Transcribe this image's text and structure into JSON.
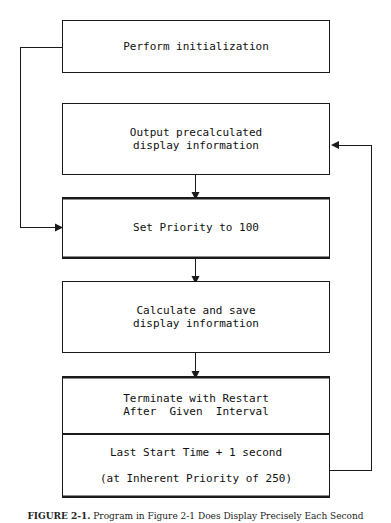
{
  "diagram": {
    "colors": {
      "line": "#1a1a1a",
      "text": "#101010",
      "background": "#ffffff"
    },
    "nodes": [
      {
        "id": "perform-initialization",
        "lines": [
          "Perform initialization"
        ],
        "style": "single"
      },
      {
        "id": "output-precalculated",
        "lines": [
          "Output precalculated",
          "display information"
        ],
        "style": "single"
      },
      {
        "id": "set-priority",
        "lines": [
          "Set Priority to 100"
        ],
        "style": "double-rule"
      },
      {
        "id": "calculate-and-save",
        "lines": [
          "Calculate and save",
          "display information"
        ],
        "style": "single"
      }
    ],
    "terminal_block": {
      "id": "terminate-with-restart",
      "style": "double-rule",
      "upper": [
        "Terminate with Restart",
        "After  Given  Interval"
      ],
      "lower": [
        "Last Start Time + 1 second",
        "(at Inherent Priority of 250)"
      ]
    },
    "connectors": [
      {
        "id": "output-to-setpriority",
        "kind": "vertical-arrow"
      },
      {
        "id": "setpriority-to-calculate",
        "kind": "vertical-arrow"
      },
      {
        "id": "calculate-to-terminate",
        "kind": "vertical-arrow"
      },
      {
        "id": "init-loopback-to-setpriority",
        "kind": "left-loop-arrow"
      },
      {
        "id": "terminate-loopback-to-output",
        "kind": "right-loop-arrow"
      }
    ]
  },
  "caption": {
    "figure_label": "FIGURE 2-1.",
    "figure_text": "Program in Figure 2-1 Does Display Precisely Each Second"
  }
}
